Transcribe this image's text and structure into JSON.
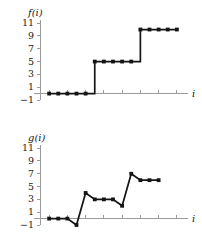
{
  "figure": {
    "background": "#ffffff",
    "line_color": "#141414",
    "axis_color": "#9b9b9b",
    "text_color": "#1a1a1a"
  },
  "chart_data": [
    {
      "type": "line",
      "title": "",
      "name": "f",
      "ylabel": "f(i)",
      "xlabel": "i",
      "step": true,
      "grid": false,
      "legend": null,
      "categories": [
        1,
        2,
        3,
        4,
        5,
        6,
        7,
        8,
        9,
        10,
        11,
        12,
        13,
        14,
        15
      ],
      "x": [
        1,
        2,
        3,
        4,
        5,
        6,
        7,
        8,
        9,
        10,
        11,
        12,
        13,
        14,
        15
      ],
      "values": [
        0,
        0,
        0,
        0,
        0,
        5,
        5,
        5,
        5,
        5,
        10,
        10,
        10,
        10,
        10
      ],
      "xlim": [
        0,
        16
      ],
      "ylim": [
        -1,
        11.8
      ],
      "yticks": [
        -1,
        1,
        3,
        5,
        7,
        9,
        11
      ],
      "ytick_labels": [
        "−1",
        "1",
        "3",
        "5",
        "7",
        "9",
        "11"
      ],
      "xticks": [
        1,
        3,
        5,
        7,
        9,
        11,
        13,
        15
      ],
      "xtick_labels": [
        "",
        "",
        "",
        "",
        "",
        "",
        "",
        ""
      ]
    },
    {
      "type": "line",
      "title": "",
      "name": "g",
      "ylabel": "g(i)",
      "xlabel": "i",
      "step": false,
      "grid": false,
      "legend": null,
      "categories": [
        1,
        2,
        3,
        4,
        5,
        6,
        7,
        8,
        9,
        10,
        11,
        12,
        13
      ],
      "x": [
        1,
        2,
        3,
        4,
        5,
        6,
        7,
        8,
        9,
        10,
        11,
        12,
        13
      ],
      "values": [
        0,
        0,
        0,
        -1,
        4,
        3,
        3,
        3,
        2,
        7,
        6,
        6,
        6
      ],
      "xlim": [
        0,
        16
      ],
      "ylim": [
        -1,
        11.8
      ],
      "yticks": [
        -1,
        1,
        3,
        5,
        7,
        9,
        11
      ],
      "ytick_labels": [
        "−1",
        "1",
        "3",
        "5",
        "7",
        "9",
        "11"
      ],
      "xticks": [
        1,
        3,
        5,
        7,
        9,
        11,
        13,
        15
      ],
      "xtick_labels": [
        "",
        "",
        "",
        "",
        "",
        "",
        "",
        ""
      ]
    }
  ]
}
